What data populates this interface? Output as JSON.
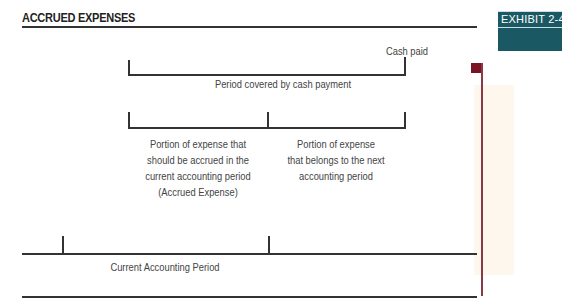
{
  "title": "ACCRUED EXPENSES",
  "exhibit": {
    "label": "EXHIBIT  2-4"
  },
  "colors": {
    "exhibit_bg": "#1a5964",
    "marker": "#7a1424",
    "cream": "#fdf7ee"
  },
  "diagram": {
    "top_bracket": {
      "end_label": "Cash paid",
      "caption": "Period covered by cash payment"
    },
    "split_bracket": {
      "left_caption": [
        "Portion of expense that",
        "should be accrued in the",
        "current accounting period",
        "(Accrued Expense)"
      ],
      "right_caption": [
        "Portion of expense",
        "that belongs to the next",
        "accounting period"
      ]
    },
    "timeline": {
      "caption": "Current Accounting Period"
    }
  }
}
